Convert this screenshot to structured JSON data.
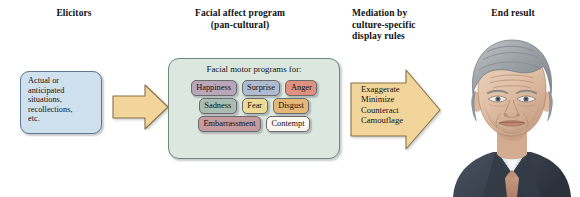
{
  "diagram": {
    "headings": {
      "elicitors": "Elicitors",
      "facial_affect_program": "Facial affect program\n(pan-cultural)",
      "mediation": "Mediation by\nculture-specific\ndisplay rules",
      "end_result": "End result"
    },
    "elicitor_box": {
      "text": "Actual or\nanticipated\nsituations,\nrecollections,\netc.",
      "fill_color": "#cfe0ee",
      "border_color": "#5e7893"
    },
    "arrow_1": {
      "label": "",
      "fill_color": "#f2d59a",
      "border_color": "#8a7340"
    },
    "program_box": {
      "caption": "Facial motor programs for:",
      "fill_color": "#dbe7df",
      "border_color": "#6d8a7c",
      "rows": [
        [
          {
            "label": "Happiness",
            "fill_color": "#b9a6bb"
          },
          {
            "label": "Surprise",
            "fill_color": "#aebbd0"
          },
          {
            "label": "Anger",
            "fill_color": "#e0907e"
          }
        ],
        [
          {
            "label": "Sadness",
            "fill_color": "#a9bdb3"
          },
          {
            "label": "Fear",
            "fill_color": "#ecdb95"
          },
          {
            "label": "Disgust",
            "fill_color": "#e5b87a"
          }
        ],
        [
          {
            "label": "Embarrassment",
            "fill_color": "#c49a9d"
          },
          {
            "label": "Contempt",
            "fill_color": "#fbf7ee"
          }
        ]
      ]
    },
    "arrow_2": {
      "text": "Exaggerate\nMinimize\nCounteract\nCamouflage",
      "fill_color": "#f2d59a",
      "border_color": "#8a7340"
    },
    "portrait": {
      "description": "illustrated portrait of a man with gray hair in a dark suit",
      "hair_color": "#9ea3a7",
      "skin_color": "#e3c3ac",
      "suit_color": "#3c4450",
      "shirt_color": "#f4f5f7",
      "tie_color": "#c79a86"
    }
  }
}
